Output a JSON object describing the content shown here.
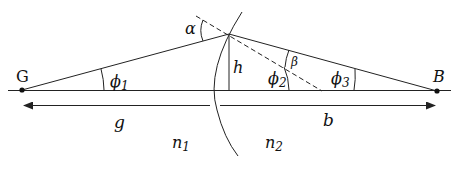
{
  "diagram": {
    "points": {
      "object": {
        "label": "G"
      },
      "image": {
        "label": "B"
      }
    },
    "angles": {
      "phi1": {
        "symbol": "ϕ",
        "sub": "1"
      },
      "phi2": {
        "symbol": "ϕ",
        "sub": "2"
      },
      "phi3": {
        "symbol": "ϕ",
        "sub": "3"
      },
      "alpha": {
        "symbol": "α"
      },
      "beta": {
        "symbol": "β"
      }
    },
    "lengths": {
      "height": "h",
      "object_distance": "g",
      "image_distance": "b"
    },
    "media": {
      "n1": {
        "symbol": "n",
        "sub": "1"
      },
      "n2": {
        "symbol": "n",
        "sub": "2"
      }
    },
    "colors": {
      "line": "#222222",
      "background": "#ffffff"
    }
  }
}
